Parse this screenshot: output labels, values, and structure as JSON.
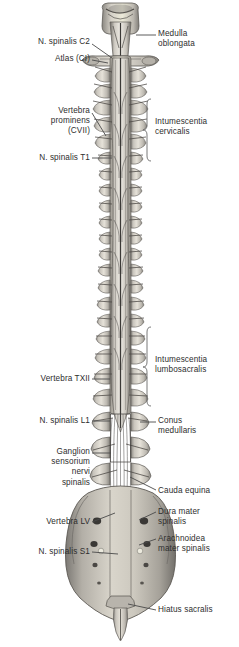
{
  "figure": {
    "view": "posterior",
    "background_color": "#ffffff",
    "text_color": "#2e2e2e",
    "leader_color": "#4a4a4a"
  },
  "labels_left": [
    {
      "id": "n-spinalis-c2",
      "text": "N. spinalis C2",
      "x": 8,
      "y": 37,
      "width": 82,
      "align": "right",
      "leader": {
        "x1": 92,
        "y1": 44,
        "x2": 112,
        "y2": 58
      }
    },
    {
      "id": "atlas-ci",
      "text": "Atlas (CI)",
      "x": 8,
      "y": 54,
      "width": 82,
      "align": "right",
      "leader": {
        "x1": 92,
        "y1": 60,
        "x2": 108,
        "y2": 63
      }
    },
    {
      "id": "vertebra-prominens-cvii",
      "text": "Vertebra\nprominens\n(CVII)",
      "x": 4,
      "y": 106,
      "width": 86,
      "align": "right",
      "leader": {
        "x1": 92,
        "y1": 113,
        "x2": 106,
        "y2": 136
      }
    },
    {
      "id": "n-spinalis-t1",
      "text": "N. spinalis T1",
      "x": 4,
      "y": 153,
      "width": 86,
      "align": "right",
      "leader": {
        "x1": 92,
        "y1": 158,
        "x2": 112,
        "y2": 158
      }
    },
    {
      "id": "vertebra-txii",
      "text": "Vertebra TXII",
      "x": 4,
      "y": 374,
      "width": 86,
      "align": "right",
      "leader": {
        "x1": 92,
        "y1": 379,
        "x2": 110,
        "y2": 379
      }
    },
    {
      "id": "n-spinalis-l1",
      "text": "N. spinalis L1",
      "x": 4,
      "y": 416,
      "width": 86,
      "align": "right",
      "leader": {
        "x1": 92,
        "y1": 421,
        "x2": 110,
        "y2": 421
      }
    },
    {
      "id": "ganglion-sensorium-nervi-spinalis",
      "text": "Ganglion\nsensorium\nnervi\nspinalis",
      "x": 4,
      "y": 447,
      "width": 86,
      "align": "right",
      "leader": {
        "x1": 92,
        "y1": 453,
        "x2": 111,
        "y2": 453
      }
    },
    {
      "id": "vertebra-lv",
      "text": "Vertebra LV",
      "x": 4,
      "y": 517,
      "width": 86,
      "align": "right",
      "leader": {
        "x1": 92,
        "y1": 522,
        "x2": 115,
        "y2": 513
      }
    },
    {
      "id": "n-spinalis-s1",
      "text": "N. spinalis S1",
      "x": 2,
      "y": 547,
      "width": 88,
      "align": "right",
      "leader": {
        "x1": 92,
        "y1": 552,
        "x2": 118,
        "y2": 554
      }
    }
  ],
  "labels_right": [
    {
      "id": "medulla-oblongata",
      "text": "Medulla\noblongata",
      "x": 158,
      "y": 29,
      "width": 80,
      "align": "left",
      "leader": {
        "x1": 136,
        "y1": 35,
        "x2": 156,
        "y2": 35
      }
    },
    {
      "id": "intumescentia-cervicalis",
      "text": "Intumescentia\ncervicalis",
      "x": 155,
      "y": 117,
      "width": 84,
      "align": "left",
      "bracket": {
        "x": 147,
        "y1": 99,
        "y2": 161,
        "tip_x": 152,
        "tip_y": 130
      }
    },
    {
      "id": "intumescentia-lumbosacralis",
      "text": "Intumescentia\nlumbosacralis",
      "x": 155,
      "y": 355,
      "width": 84,
      "align": "left",
      "bracket": {
        "x": 147,
        "y1": 327,
        "y2": 406,
        "tip_x": 152,
        "tip_y": 367
      }
    },
    {
      "id": "conus-medullaris",
      "text": "Conus\nmedullaris",
      "x": 158,
      "y": 416,
      "width": 80,
      "align": "left",
      "leader": {
        "x1": 140,
        "y1": 422,
        "x2": 156,
        "y2": 422
      }
    },
    {
      "id": "cauda-equina",
      "text": "Cauda equina",
      "x": 158,
      "y": 486,
      "width": 80,
      "align": "left",
      "leader": {
        "x1": 130,
        "y1": 477,
        "x2": 156,
        "y2": 490
      }
    },
    {
      "id": "dura-mater-spinalis",
      "text": "Dura mater\nspinalis",
      "x": 158,
      "y": 507,
      "width": 80,
      "align": "left",
      "leader": {
        "x1": 139,
        "y1": 520,
        "x2": 156,
        "y2": 512
      }
    },
    {
      "id": "arachnoidea-mater-spinalis",
      "text": "Arachnoidea\nmater spinalis",
      "x": 158,
      "y": 534,
      "width": 80,
      "align": "left",
      "leader": {
        "x1": 139,
        "y1": 545,
        "x2": 156,
        "y2": 539
      }
    },
    {
      "id": "hiatus-sacralis",
      "text": "Hiatus sacralis",
      "x": 158,
      "y": 605,
      "width": 80,
      "align": "left",
      "leader": {
        "x1": 128,
        "y1": 604,
        "x2": 156,
        "y2": 610
      }
    }
  ]
}
